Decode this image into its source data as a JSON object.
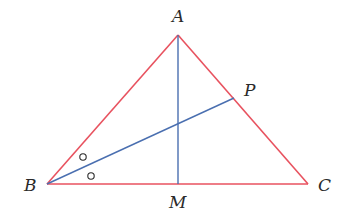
{
  "diagram": {
    "type": "geometry-triangle",
    "points": {
      "A": {
        "label": "A",
        "x": 178,
        "y": 35
      },
      "B": {
        "label": "B",
        "x": 47,
        "y": 184
      },
      "C": {
        "label": "C",
        "x": 308,
        "y": 184
      },
      "M": {
        "label": "M",
        "x": 178,
        "y": 184
      },
      "P": {
        "label": "P",
        "x": 234,
        "y": 98
      }
    },
    "labels": {
      "A": "A",
      "B": "B",
      "C": "C",
      "M": "M",
      "P": "P"
    },
    "segments": [
      {
        "from": "A",
        "to": "B",
        "color": "#e8525f"
      },
      {
        "from": "A",
        "to": "C",
        "color": "#e8525f"
      },
      {
        "from": "B",
        "to": "C",
        "color": "#e8525f"
      },
      {
        "from": "A",
        "to": "M",
        "color": "#4a6fb0"
      },
      {
        "from": "B",
        "to": "P",
        "color": "#4a6fb0"
      }
    ],
    "angle_marks": [
      {
        "symbol": "o",
        "x": 83,
        "y": 157
      },
      {
        "symbol": "o",
        "x": 91,
        "y": 176
      }
    ],
    "colors": {
      "triangle": "#e8525f",
      "cevians": "#4a6fb0",
      "labels": "#2a2a2a"
    }
  }
}
